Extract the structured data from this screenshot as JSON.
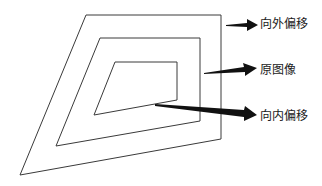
{
  "diagram": {
    "labels": {
      "outward": "向外偏移",
      "original": "原图像",
      "inward": "向内偏移"
    },
    "colors": {
      "line": "#3a3a3a",
      "arrow": "#111111",
      "background": "#ffffff"
    }
  }
}
